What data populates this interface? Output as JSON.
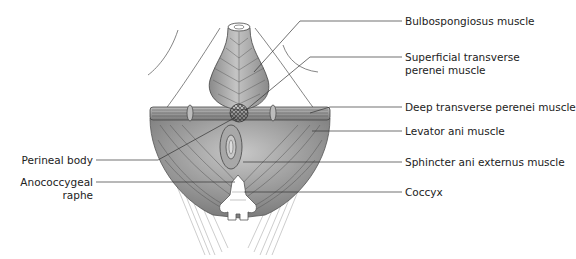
{
  "figure": {
    "colors": {
      "muscle_fill": "#9a9a9a",
      "muscle_dark": "#7a7a7a",
      "muscle_light": "#c4c4c4",
      "line": "#333333",
      "bone": "#ffffff",
      "fascia": "#bdbdbd"
    },
    "labels_right": [
      {
        "id": "bulbospongiosus",
        "text": "Bulbospongiosus muscle",
        "y": 21
      },
      {
        "id": "superficial-transverse-1",
        "text": "Superficial transverse",
        "y": 57
      },
      {
        "id": "superficial-transverse-2",
        "text": "perenei muscle",
        "y": 70
      },
      {
        "id": "deep-transverse",
        "text": "Deep transverse perenei muscle",
        "y": 107
      },
      {
        "id": "levator-ani",
        "text": "Levator ani muscle",
        "y": 131
      },
      {
        "id": "sphincter-ani",
        "text": "Sphincter ani externus muscle",
        "y": 162
      },
      {
        "id": "coccyx",
        "text": "Coccyx",
        "y": 192
      }
    ],
    "labels_left": [
      {
        "id": "perineal-body",
        "text": "Perineal body",
        "y": 160
      },
      {
        "id": "anococcygeal-1",
        "text": "Anococcygeal",
        "y": 182
      },
      {
        "id": "anococcygeal-2",
        "text": "raphe",
        "y": 195
      }
    ]
  }
}
